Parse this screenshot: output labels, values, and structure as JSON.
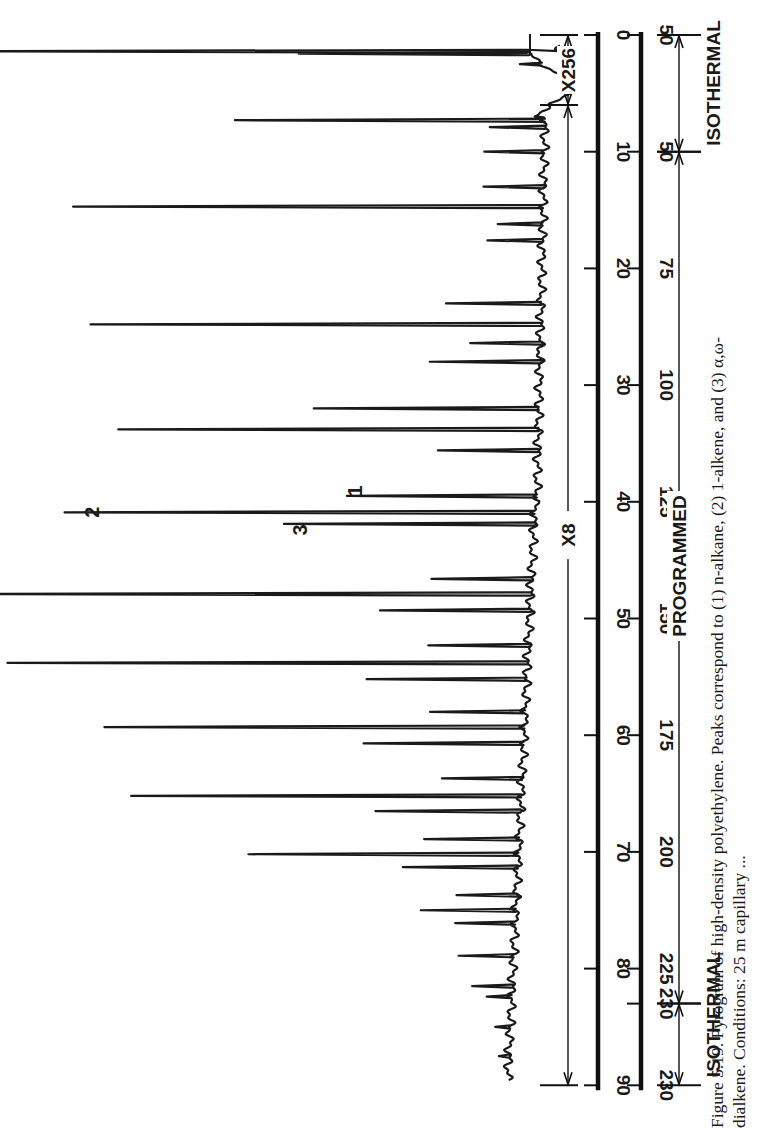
{
  "figure": {
    "caption_line1": "Figure 5.19. Pyrogram of high-density polyethylene. Peaks correspond to (1) n-alkane, (2) 1-alkene, and (3) α,ω-",
    "caption_line2": "dialkene. Conditions: 25 m capillary ..."
  },
  "annotations": {
    "x256": "X256",
    "x8": "X8",
    "programmed": "PROGRAMMED",
    "isothermal_top": "ISOTHERMAL",
    "isothermal_bottom": "ISOTHERMAL",
    "peak_label_1": "1",
    "peak_label_2": "2",
    "peak_label_3": "3"
  },
  "chart_data": {
    "type": "line",
    "title": "Pyrogram of high-density polyethylene",
    "orientation": "rotated 90° (time axis vertical, signal extends leftward)",
    "xlabel": "Time (min)",
    "x2label": "Temperature (°C)",
    "ylabel": "Detector response",
    "xlim": [
      0,
      90
    ],
    "time_ticks": [
      0,
      10,
      20,
      30,
      40,
      50,
      60,
      70,
      80,
      90
    ],
    "temperature_ticks": [
      {
        "time": 0,
        "label": "50"
      },
      {
        "time": 10,
        "label": "50"
      },
      {
        "time": 20,
        "label": "75"
      },
      {
        "time": 30,
        "label": "100"
      },
      {
        "time": 40,
        "label": "125"
      },
      {
        "time": 50,
        "label": "150"
      },
      {
        "time": 60,
        "label": "175"
      },
      {
        "time": 70,
        "label": "200"
      },
      {
        "time": 80,
        "label": "225"
      },
      {
        "time": 83,
        "label": "230"
      },
      {
        "time": 90,
        "label": "230"
      }
    ],
    "program_segments": [
      {
        "from": 0,
        "to": 10,
        "label": "ISOTHERMAL"
      },
      {
        "from": 10,
        "to": 83,
        "label": "PROGRAMMED"
      },
      {
        "from": 83,
        "to": 90,
        "label": "ISOTHERMAL"
      }
    ],
    "attenuation_segments": [
      {
        "from": 0,
        "to": 6,
        "label": "X256"
      },
      {
        "from": 6,
        "to": 90,
        "label": "X8"
      }
    ],
    "peak_triplet_labels": [
      {
        "time": 39.5,
        "label": "1",
        "meaning": "n-alkane"
      },
      {
        "time": 40.9,
        "label": "2",
        "meaning": "1-alkene"
      },
      {
        "time": 41.9,
        "label": "3",
        "meaning": "α,ω-dialkene"
      }
    ],
    "peaks": [
      {
        "t": 1.4,
        "h": 590
      },
      {
        "t": 1.6,
        "h": 230
      },
      {
        "t": 2.5,
        "h": 22
      },
      {
        "t": 7.3,
        "h": 310
      },
      {
        "t": 7.9,
        "h": 55
      },
      {
        "t": 10.0,
        "h": 60
      },
      {
        "t": 13.0,
        "h": 60
      },
      {
        "t": 14.7,
        "h": 470
      },
      {
        "t": 16.2,
        "h": 45
      },
      {
        "t": 17.6,
        "h": 55
      },
      {
        "t": 23.0,
        "h": 95
      },
      {
        "t": 24.8,
        "h": 450
      },
      {
        "t": 26.4,
        "h": 70
      },
      {
        "t": 28.0,
        "h": 110
      },
      {
        "t": 32.0,
        "h": 225
      },
      {
        "t": 33.8,
        "h": 420
      },
      {
        "t": 35.6,
        "h": 100
      },
      {
        "t": 39.5,
        "h": 190
      },
      {
        "t": 40.9,
        "h": 470
      },
      {
        "t": 41.9,
        "h": 250
      },
      {
        "t": 46.6,
        "h": 100
      },
      {
        "t": 47.9,
        "h": 570
      },
      {
        "t": 49.3,
        "h": 150
      },
      {
        "t": 52.3,
        "h": 100
      },
      {
        "t": 53.8,
        "h": 520
      },
      {
        "t": 55.2,
        "h": 160
      },
      {
        "t": 58.0,
        "h": 95
      },
      {
        "t": 59.3,
        "h": 420
      },
      {
        "t": 60.7,
        "h": 160
      },
      {
        "t": 63.7,
        "h": 80
      },
      {
        "t": 65.2,
        "h": 390
      },
      {
        "t": 66.5,
        "h": 145
      },
      {
        "t": 68.9,
        "h": 95
      },
      {
        "t": 70.2,
        "h": 270
      },
      {
        "t": 71.3,
        "h": 115
      },
      {
        "t": 73.7,
        "h": 60
      },
      {
        "t": 75.0,
        "h": 95
      },
      {
        "t": 76.1,
        "h": 60
      },
      {
        "t": 78.9,
        "h": 55
      },
      {
        "t": 81.5,
        "h": 40
      },
      {
        "t": 82.4,
        "h": 25
      },
      {
        "t": 85.0,
        "h": 15
      },
      {
        "t": 87.5,
        "h": 10
      }
    ]
  }
}
